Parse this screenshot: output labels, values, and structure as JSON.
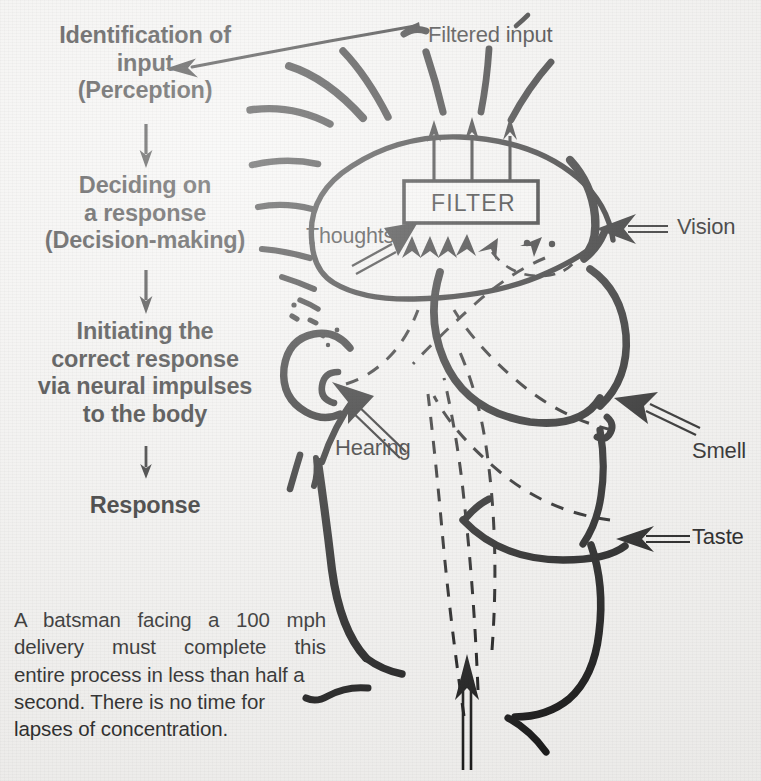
{
  "meta": {
    "figure_kind": "information-processing diagram",
    "background_color": "#f3f2f0",
    "ink_color": "#111111"
  },
  "cutoff_title": {
    "text": "attention",
    "note_visible": "partially cropped line of text at very top edge"
  },
  "flowchart": {
    "steps": [
      {
        "id": "perception",
        "lines": [
          "Identification of",
          "input",
          "(Perception)"
        ]
      },
      {
        "id": "decision",
        "lines": [
          "Deciding on",
          "a response",
          "(Decision-making)"
        ]
      },
      {
        "id": "initiation",
        "lines": [
          "Initiating the",
          "correct response",
          "via neural impulses",
          "to the body"
        ]
      },
      {
        "id": "response",
        "lines": [
          "Response"
        ]
      }
    ],
    "connector_icon": "down-arrow-icon"
  },
  "diagram": {
    "filter_box_label": "FILTER",
    "labels": {
      "filtered_input": "Filtered input",
      "thoughts": "Thoughts",
      "hearing": "Hearing",
      "vision": "Vision",
      "smell": "Smell",
      "taste": "Taste"
    },
    "icons": {
      "pointer_arrow": "arrow-icon",
      "double_line_arrow": "double-line-arrow-icon",
      "dashed_pathway": "dashed-line-icon",
      "radiating_burst": "radiating-lines-icon",
      "head_outline": "head-profile-icon",
      "brain_outline": "brain-outline-icon"
    }
  },
  "caption": {
    "lines": [
      "A batsman facing a 100 mph",
      "delivery must complete this",
      "entire process in less than half a",
      "second. There is no time for",
      "lapses of concentration."
    ],
    "full_text": "A batsman facing a 100 mph delivery must complete this entire process in less than half a second. There is no time for lapses of concentration."
  }
}
